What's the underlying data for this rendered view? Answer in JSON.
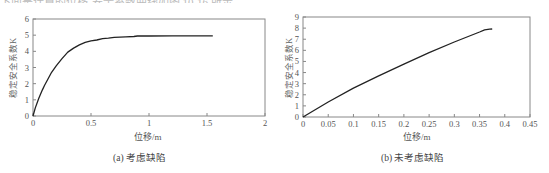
{
  "page": {
    "top_text_fragment": "下面是计算的位移-安全系数曲线如图 10-16 所示。"
  },
  "chart_data": [
    {
      "id": "a",
      "type": "line",
      "title": "",
      "caption": "(a) 考虑缺陷",
      "xlabel": "位移/m",
      "ylabel": "稳定安全系数K",
      "xlim": [
        0,
        2
      ],
      "ylim": [
        0,
        6
      ],
      "xticks": [
        0,
        0.5,
        1,
        1.5,
        2
      ],
      "xtick_labels": [
        "0",
        "0.5",
        "1",
        "1.5",
        "2"
      ],
      "yticks": [
        0,
        1,
        2,
        3,
        4,
        5,
        6
      ],
      "ytick_labels": [
        "0",
        "1",
        "2",
        "3",
        "4",
        "5",
        "6"
      ],
      "grid": false,
      "legend": null,
      "series": [
        {
          "name": "考虑缺陷",
          "x": [
            0,
            0.02,
            0.05,
            0.08,
            0.1,
            0.13,
            0.16,
            0.2,
            0.25,
            0.3,
            0.35,
            0.4,
            0.45,
            0.5,
            0.55,
            0.6,
            0.65,
            0.7,
            0.75,
            0.8,
            0.87,
            0.9,
            1.0,
            1.2,
            1.4,
            1.55
          ],
          "y": [
            0,
            0.5,
            1.1,
            1.6,
            1.9,
            2.3,
            2.7,
            3.1,
            3.55,
            3.95,
            4.2,
            4.4,
            4.55,
            4.65,
            4.7,
            4.78,
            4.82,
            4.87,
            4.88,
            4.9,
            4.92,
            4.95,
            4.95,
            4.96,
            4.96,
            4.96
          ]
        }
      ]
    },
    {
      "id": "b",
      "type": "line",
      "title": "",
      "caption": "(b) 未考虑缺陷",
      "xlabel": "位移/m",
      "ylabel": "稳定安全系数K",
      "xlim": [
        0,
        0.45
      ],
      "ylim": [
        0,
        9
      ],
      "xticks": [
        0,
        0.05,
        0.1,
        0.15,
        0.2,
        0.25,
        0.3,
        0.35,
        0.4,
        0.45
      ],
      "xtick_labels": [
        "0",
        "0.05",
        "0.1",
        "0.15",
        "0.2",
        "0.25",
        "0.3",
        "0.35",
        "0.4",
        "0.45"
      ],
      "yticks": [
        0,
        1,
        2,
        3,
        4,
        5,
        6,
        7,
        8,
        9
      ],
      "ytick_labels": [
        "0",
        "1",
        "2",
        "3",
        "4",
        "5",
        "6",
        "7",
        "8",
        "9"
      ],
      "grid": false,
      "legend": null,
      "series": [
        {
          "name": "未考虑缺陷",
          "x": [
            0,
            0.05,
            0.1,
            0.15,
            0.2,
            0.25,
            0.3,
            0.35,
            0.36,
            0.37,
            0.375
          ],
          "y": [
            0,
            1.35,
            2.6,
            3.7,
            4.75,
            5.8,
            6.75,
            7.65,
            7.85,
            7.9,
            7.92
          ]
        }
      ]
    }
  ]
}
